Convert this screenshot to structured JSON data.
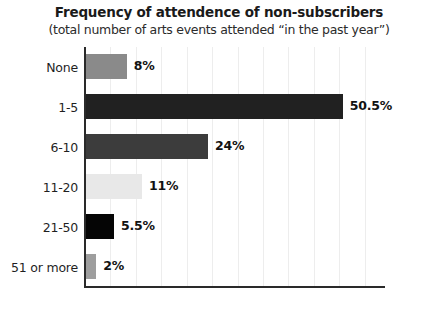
{
  "chart_data": {
    "type": "bar",
    "orientation": "horizontal",
    "title": "Frequency of attendence of non-subscribers",
    "subtitle": "(total number of arts events attended “in the past year”)",
    "xlabel": "",
    "ylabel": "",
    "xlim": [
      0,
      59
    ],
    "grid": true,
    "grid_step": 5,
    "legend": "none",
    "categories": [
      "None",
      "1-5",
      "6-10",
      "11-20",
      "21-50",
      "51 or more"
    ],
    "values": [
      8,
      50.5,
      24,
      11,
      5.5,
      2
    ],
    "value_labels": [
      "8%",
      "50.5%",
      "24%",
      "11%",
      "5.5%",
      "2%"
    ],
    "bar_colors": [
      "#8a8a8a",
      "#212121",
      "#3c3c3c",
      "#e8e8e8",
      "#050505",
      "#9e9e9e"
    ]
  },
  "axes": {
    "axis_color": "#2a2a2a",
    "gridline_color": "#ededed"
  }
}
